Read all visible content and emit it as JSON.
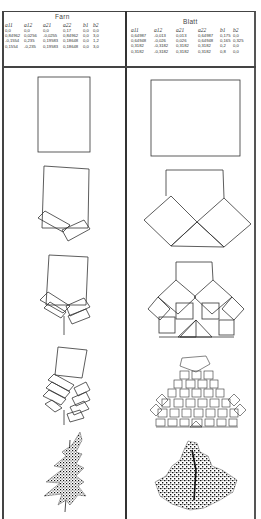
{
  "document": {
    "panels": [
      {
        "title": "Farn",
        "columns": [
          "a11",
          "a12",
          "a21",
          "a22",
          "b1",
          "b2"
        ],
        "rows": [
          [
            "0,0",
            "0,0",
            "0,0",
            "0,17",
            "0,0",
            "0,0"
          ],
          [
            "0,84962",
            "0,0256",
            "-0,0255",
            "0,84962",
            "0,0",
            "3,0"
          ],
          [
            "-0,1554",
            "0,235",
            "0,19583",
            "0,18648",
            "0,0",
            "1,2"
          ],
          [
            "0,1554",
            "-0,235",
            "0,19583",
            "0,18648",
            "0,0",
            "3,0"
          ]
        ],
        "stages": [
          "initial rectangle",
          "iteration 1",
          "iteration 2",
          "iteration 3",
          "fern attractor"
        ]
      },
      {
        "title": "Blatt",
        "columns": [
          "a11",
          "a12",
          "a21",
          "a22",
          "b1",
          "b2"
        ],
        "rows": [
          [
            "0,64987",
            "-0,013",
            "0,013",
            "0,64987",
            "0,175",
            "0,0"
          ],
          [
            "0,64948",
            "-0,026",
            "0,026",
            "0,64948",
            "0,165",
            "0,325"
          ],
          [
            "0,3182",
            "-0,3182",
            "0,3182",
            "0,3182",
            "0,2",
            "0,0"
          ],
          [
            "0,3182",
            "-0,3182",
            "0,3182",
            "0,3182",
            "0,8",
            "0,0"
          ]
        ],
        "stages": [
          "initial square",
          "iteration 1",
          "iteration 2",
          "iteration 3",
          "leaf attractor"
        ]
      }
    ],
    "colors": {
      "ink": "#222222",
      "paper": "#ffffff",
      "frame": "#444444"
    }
  }
}
